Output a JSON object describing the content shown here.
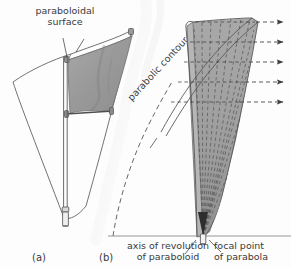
{
  "figure": {
    "background_color": "#fdfdfd",
    "ink_color": "#4a4a4a",
    "shade_color": "#9b9b9b"
  },
  "panels": [
    {
      "id": "a",
      "caption": "(a)",
      "description": "Three-dimensional paraboloidal dish on a central mast with a shaded wedge panel"
    },
    {
      "id": "b",
      "caption": "(b)",
      "description": "Parabolic cross-section showing parallel incoming rays converging at the focal point"
    }
  ],
  "labels": {
    "paraboloidal_surface": "paraboloidal\nsurface",
    "paraboloidal_surface_line1": "paraboloidal",
    "paraboloidal_surface_line2": "surface",
    "parabolic_contour": "parabolic contour",
    "axis_of_revolution_line1": "axis of revolution",
    "axis_of_revolution_line2": "of paraboloid",
    "focal_point_line1": "focal point",
    "focal_point_line2": "of parabola",
    "panel_a": "(a)",
    "panel_b": "(b)"
  },
  "diagram_data": {
    "type": "technical-diagram",
    "ray_count": 5,
    "ray_y_positions": [
      22,
      42,
      62,
      82,
      102
    ],
    "ray_x_start": 196,
    "ray_x_end": 286,
    "ray_style": "dashed-with-arrowhead",
    "ray_direction": "rightward",
    "baseline_y": 236,
    "focal_point": {
      "x": 203,
      "y": 236
    },
    "fan_line_count": 9,
    "grid_rows": 5,
    "grid_cols": 4,
    "dish_mast_x": 65,
    "dish_mast_base_y": 227,
    "contour_rotation_deg": -47
  }
}
